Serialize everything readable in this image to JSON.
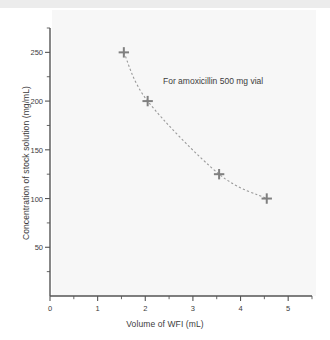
{
  "chart_data": {
    "type": "scatter",
    "title": "",
    "xlabel": "Volume of WFI (mL)",
    "ylabel": "Concentration of stock solution (mg/mL)",
    "xlim": [
      0,
      5.5
    ],
    "ylim": [
      0,
      275
    ],
    "grid": false,
    "legend": null,
    "annotations": [
      {
        "text": "For amoxicillin 500 mg vial",
        "x": 2.35,
        "y": 211
      }
    ],
    "x_ticks_major": [
      0,
      1,
      2,
      3,
      4,
      5
    ],
    "x_ticks_major_labels": [
      "0",
      "1",
      "2",
      "3",
      "4",
      "5"
    ],
    "x_ticks_minor": [
      0.5,
      1.5,
      2.5,
      3.5,
      4.5,
      5.5
    ],
    "y_ticks_major": [
      50,
      100,
      150,
      200,
      250
    ],
    "y_ticks_major_labels": [
      "50",
      "100",
      "150",
      "200",
      "250"
    ],
    "y_ticks_minor": [
      25,
      75,
      125,
      175,
      225,
      275
    ],
    "series": [
      {
        "name": "Stock concentration vs diluent volume",
        "marker": "plus",
        "linestyle": "dashed",
        "color": "#808080",
        "x": [
          1.55,
          2.05,
          3.55,
          4.55
        ],
        "y": [
          250,
          200,
          125,
          100
        ]
      }
    ],
    "colors": {
      "marker": "#808080",
      "line": "#9a9a9a",
      "axis": "#555555",
      "text": "#3c3c3c",
      "plot_background": "#f7f7f7",
      "figure_background": "#ffffff"
    }
  }
}
